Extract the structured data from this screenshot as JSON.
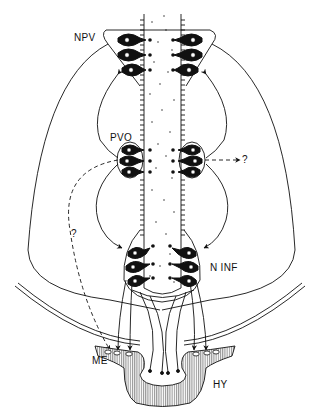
{
  "diagram": {
    "type": "neuroanatomy schematic",
    "labels": {
      "npv": "NPV",
      "pvo": "PVO",
      "ninf": "N INF",
      "me": "ME",
      "hy": "HY",
      "q_right": "?",
      "q_left": "?"
    },
    "colors": {
      "ink": "#111111",
      "background": "#ffffff"
    }
  }
}
